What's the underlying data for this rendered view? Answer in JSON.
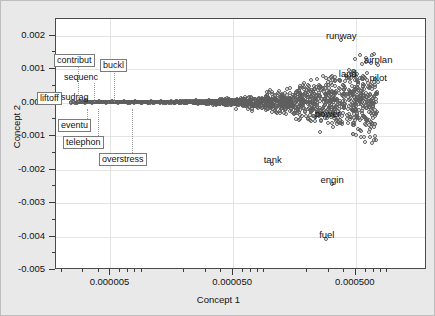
{
  "figure": {
    "background_color": "#e9e9e9",
    "plot_background_color": "#ffffff",
    "frame_color": "#4a4a4a"
  },
  "chart_data": {
    "type": "scatter",
    "title": "",
    "xlabel": "Concept 1",
    "ylabel": "Concept 2",
    "xscale": "log",
    "yscale": "linear",
    "xlim": [
      1.8e-06,
      0.0019
    ],
    "ylim": [
      -0.005,
      0.0025
    ],
    "xticks": [
      5e-06,
      5e-05,
      0.0005
    ],
    "xticklabels": [
      "0.000005",
      "0.000050",
      "0.000500"
    ],
    "yticks": [
      0.002,
      0.001,
      0.0,
      -0.001,
      -0.002,
      -0.003,
      -0.004,
      -0.005
    ],
    "yticklabels": [
      "0.002",
      "0.001",
      "0.000",
      "-0.001",
      "-0.002",
      "-0.003",
      "-0.004",
      "-0.005"
    ],
    "grid": true,
    "legend": null,
    "marker": "open-circle",
    "marker_color": "#5e5e5e",
    "labeled_points": [
      {
        "label": "runway",
        "x": 0.00038,
        "y": 0.00185,
        "boxed": false,
        "label_dx": 0,
        "label_dy": -11
      },
      {
        "label": "airplan",
        "x": 0.00076,
        "y": 0.00112,
        "boxed": false,
        "label_dx": 0,
        "label_dy": -11
      },
      {
        "label": "land",
        "x": 0.00043,
        "y": 0.00072,
        "boxed": false,
        "label_dx": 0,
        "label_dy": -11
      },
      {
        "label": "pilot",
        "x": 0.00076,
        "y": 0.0006,
        "boxed": false,
        "label_dx": 0,
        "label_dy": -11
      },
      {
        "label": "power",
        "x": 0.000295,
        "y": -0.00048,
        "boxed": false,
        "label_dx": 0,
        "label_dy": -11
      },
      {
        "label": "tank",
        "x": 0.000105,
        "y": -0.00185,
        "boxed": false,
        "label_dx": 0,
        "label_dy": -11
      },
      {
        "label": "engin",
        "x": 0.00032,
        "y": -0.00245,
        "boxed": false,
        "label_dx": 0,
        "label_dy": -11
      },
      {
        "label": "fuel",
        "x": 0.00029,
        "y": -0.0041,
        "boxed": false,
        "label_dx": 0,
        "label_dy": -11
      }
    ],
    "callout_labels": [
      {
        "label": "contribut",
        "boxed": true,
        "x_px": 53,
        "y_px": 53,
        "leader_x": 77,
        "leader_y0": 64,
        "leader_y1": 101
      },
      {
        "label": "buckl",
        "boxed": true,
        "x_px": 99,
        "y_px": 58,
        "leader_x": 113,
        "leader_y0": 69,
        "leader_y1": 101
      },
      {
        "label": "sequenc",
        "boxed": false,
        "x_px": 61,
        "y_px": 71,
        "leader_x": 93,
        "leader_y0": 82,
        "leader_y1": 101
      },
      {
        "label": "liftoff",
        "boxed": true,
        "x_px": 36,
        "y_px": 91,
        "leader_x": 0,
        "leader_y0": 0,
        "leader_y1": 0
      },
      {
        "label": "sudrag",
        "boxed": false,
        "x_px": 58,
        "y_px": 91,
        "leader_x": 0,
        "leader_y0": 0,
        "leader_y1": 0
      },
      {
        "label": "eventu",
        "boxed": true,
        "x_px": 57,
        "y_px": 118,
        "leader_x": 86,
        "leader_y0": 108,
        "leader_y1": 118
      },
      {
        "label": "telephon",
        "boxed": true,
        "x_px": 62,
        "y_px": 135,
        "leader_x": 97,
        "leader_y0": 108,
        "leader_y1": 135
      },
      {
        "label": "overstress",
        "boxed": true,
        "x_px": 98,
        "y_px": 152,
        "leader_x": 131,
        "leader_y0": 108,
        "leader_y1": 152
      }
    ],
    "cluster_description": "dense horizontal band of open circles near Concept 2 = 0, widening toward larger Concept 1",
    "points": [
      [
        3.2e-06,
        6e-05
      ],
      [
        3.6e-06,
        -2e-05
      ],
      [
        4.1e-06,
        3e-05
      ],
      [
        4.6e-06,
        1e-05
      ],
      [
        5.2e-06,
        2e-05
      ],
      [
        5.8e-06,
        -1e-05
      ],
      [
        6.5e-06,
        3e-05
      ],
      [
        7.2e-06,
        0.0
      ],
      [
        8e-06,
        2e-05
      ],
      [
        8.9e-06,
        -2e-05
      ],
      [
        9.8e-06,
        1e-05
      ],
      [
        1.08e-05,
        3e-05
      ],
      [
        1.19e-05,
        0.0
      ],
      [
        1.31e-05,
        2e-05
      ],
      [
        1.44e-05,
        -1e-05
      ],
      [
        1.58e-05,
        2e-05
      ],
      [
        1.74e-05,
        0.0
      ],
      [
        1.91e-05,
        3e-05
      ],
      [
        2.1e-05,
        -2e-05
      ],
      [
        2.3e-05,
        1e-05
      ],
      [
        2.53e-05,
        2e-05
      ],
      [
        2.78e-05,
        0.0
      ],
      [
        3.05e-05,
        -3e-05
      ],
      [
        3.35e-05,
        2e-05
      ],
      [
        3.68e-05,
        1e-05
      ],
      [
        4.04e-05,
        -1e-05
      ],
      [
        4.43e-05,
        3e-05
      ],
      [
        4.86e-05,
        0.0
      ],
      [
        5.34e-05,
        2e-05
      ],
      [
        5.86e-05,
        -2e-05
      ],
      [
        6.43e-05,
        4e-05
      ],
      [
        7.06e-05,
        0.0
      ],
      [
        7.75e-05,
        -3e-05
      ],
      [
        8.5e-05,
        3e-05
      ],
      [
        9.33e-05,
        1e-05
      ],
      [
        0.0001024,
        -2e-05
      ],
      [
        0.0001124,
        4e-05
      ],
      [
        0.0001233,
        0.0
      ],
      [
        0.0001353,
        -4e-05
      ],
      [
        0.0001485,
        3e-05
      ],
      [
        0.000163,
        5e-05
      ],
      [
        0.0001789,
        -2e-05
      ],
      [
        0.0001963,
        1e-05
      ],
      [
        0.0002154,
        6e-05
      ],
      [
        0.0002364,
        -5e-05
      ],
      [
        0.0002594,
        3e-05
      ],
      [
        0.0002847,
        8e-05
      ],
      [
        0.0003124,
        -3e-05
      ],
      [
        0.0003429,
        5e-05
      ],
      [
        0.0003762,
        -6e-05
      ],
      [
        0.0004129,
        2e-05
      ],
      [
        0.0004531,
        9e-05
      ],
      [
        0.0004973,
        -4e-05
      ],
      [
        0.0005457,
        6e-05
      ],
      [
        0.0005989,
        0.0
      ],
      [
        0.0006573,
        -8e-05
      ]
    ]
  }
}
